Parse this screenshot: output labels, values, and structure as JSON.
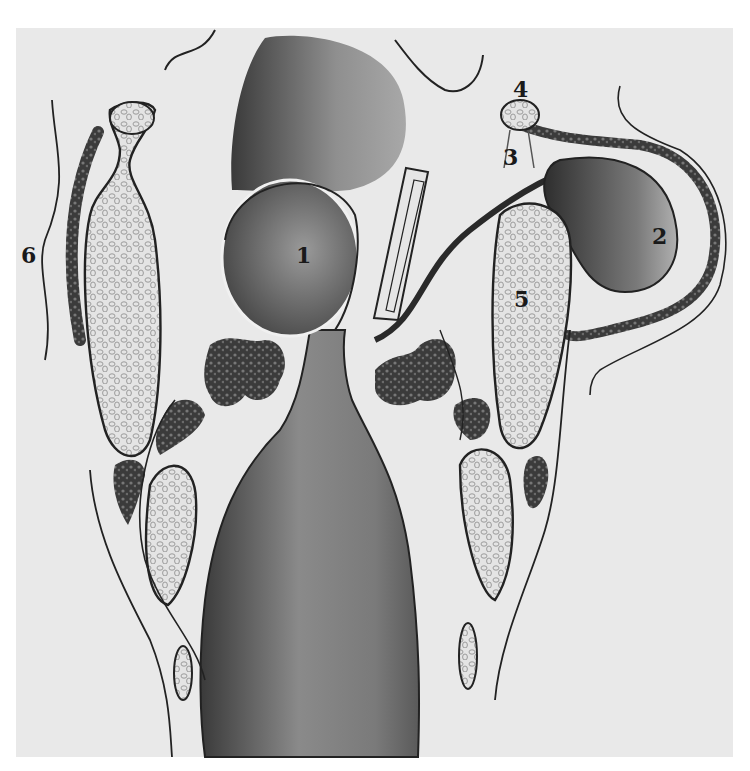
{
  "figure": {
    "type": "anatomical illustration",
    "background_color": "#e9e9e9",
    "page_color": "#ffffff",
    "ink_color": "#1a1a1a",
    "labels": [
      {
        "id": "1",
        "text": "1",
        "x": 296,
        "y": 244
      },
      {
        "id": "2",
        "text": "2",
        "x": 652,
        "y": 225
      },
      {
        "id": "3",
        "text": "3",
        "x": 503,
        "y": 146
      },
      {
        "id": "4",
        "text": "4",
        "x": 513,
        "y": 82
      },
      {
        "id": "5",
        "text": "5",
        "x": 514,
        "y": 288
      },
      {
        "id": "6",
        "text": "6",
        "x": 21,
        "y": 244
      }
    ]
  }
}
